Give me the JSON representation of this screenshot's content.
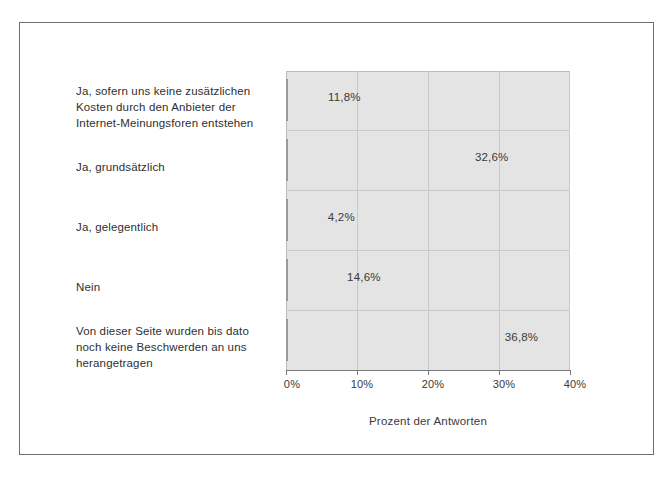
{
  "chart_data": {
    "type": "bar",
    "orientation": "horizontal",
    "title": "",
    "xlabel": "Prozent der Antworten",
    "ylabel": "",
    "xlim": [
      0,
      40
    ],
    "xticks": [
      "0%",
      "10%",
      "20%",
      "30%",
      "40%"
    ],
    "xtick_values": [
      0,
      10,
      20,
      30,
      40
    ],
    "grid": true,
    "legend": "none",
    "categories": [
      "Ja, sofern uns keine zusätzlichen Kosten durch den Anbieter der Internet-Meinungsforen entstehen",
      "Ja, grundsätzlich",
      "Ja, gelegentlich",
      "Nein",
      "Von dieser Seite wurden bis dato noch keine Beschwerden an uns herangetragen"
    ],
    "values": [
      11.8,
      32.6,
      4.2,
      14.6,
      36.8
    ],
    "value_labels": [
      "11,8%",
      "32,6%",
      "4,2%",
      "14,6%",
      "36,8%"
    ],
    "colors": {
      "bar_fill": "#ffffff",
      "bar_border": "#9a9a9a",
      "bar_shadow": "#000000",
      "plot_background": "#e4e4e4",
      "gridline": "#c9c9c9",
      "axis": "#7a7a7a",
      "text": "#2f2f2f"
    }
  },
  "categories_wrapped": [
    [
      "Ja, sofern uns keine zusätzlichen",
      "Kosten durch den Anbieter der",
      "Internet-Meinungsforen entstehen"
    ],
    [
      "Ja, grundsätzlich"
    ],
    [
      "Ja, gelegentlich"
    ],
    [
      "Nein"
    ],
    [
      "Von dieser Seite wurden bis dato",
      "noch keine Beschwerden an uns",
      "herangetragen"
    ]
  ],
  "axis": {
    "title": "Prozent der Antworten",
    "ticks": [
      "0%",
      "10%",
      "20%",
      "30%",
      "40%"
    ]
  }
}
